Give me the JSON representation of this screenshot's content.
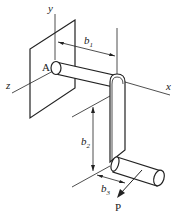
{
  "diagram": {
    "type": "crank-shaft-3d-mechanics",
    "labels": {
      "y_axis": "y",
      "z_axis": "z",
      "x_axis": "x",
      "point_A": "A",
      "force": "P",
      "b1_main": "b",
      "b1_sub": "1",
      "b2_main": "b",
      "b2_sub": "2",
      "b3_main": "b",
      "b3_sub": "3"
    },
    "colors": {
      "line": "#222222",
      "fill": "#ffffff"
    }
  }
}
